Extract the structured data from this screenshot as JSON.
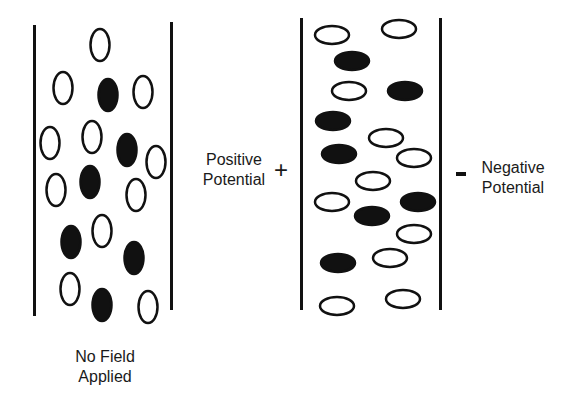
{
  "diagram": {
    "left_panel": {
      "caption_line1": "No Field",
      "caption_line2": "Applied",
      "particles": [
        {
          "cx": 100,
          "cy": 45,
          "filled": false
        },
        {
          "cx": 63,
          "cy": 88,
          "filled": false
        },
        {
          "cx": 108,
          "cy": 95,
          "filled": true
        },
        {
          "cx": 143,
          "cy": 92,
          "filled": false
        },
        {
          "cx": 50,
          "cy": 143,
          "filled": false
        },
        {
          "cx": 92,
          "cy": 137,
          "filled": false
        },
        {
          "cx": 127,
          "cy": 150,
          "filled": true
        },
        {
          "cx": 156,
          "cy": 162,
          "filled": false
        },
        {
          "cx": 56,
          "cy": 190,
          "filled": false
        },
        {
          "cx": 90,
          "cy": 182,
          "filled": true
        },
        {
          "cx": 136,
          "cy": 195,
          "filled": false
        },
        {
          "cx": 71,
          "cy": 242,
          "filled": true
        },
        {
          "cx": 102,
          "cy": 231,
          "filled": false
        },
        {
          "cx": 134,
          "cy": 258,
          "filled": true
        },
        {
          "cx": 70,
          "cy": 289,
          "filled": false
        },
        {
          "cx": 102,
          "cy": 305,
          "filled": true
        },
        {
          "cx": 148,
          "cy": 307,
          "filled": false
        }
      ]
    },
    "right_panel": {
      "particles": [
        {
          "cx": 332,
          "cy": 35,
          "filled": false
        },
        {
          "cx": 399,
          "cy": 29,
          "filled": false
        },
        {
          "cx": 352,
          "cy": 61,
          "filled": true
        },
        {
          "cx": 349,
          "cy": 91,
          "filled": false
        },
        {
          "cx": 405,
          "cy": 91,
          "filled": true
        },
        {
          "cx": 333,
          "cy": 121,
          "filled": true
        },
        {
          "cx": 386,
          "cy": 138,
          "filled": false
        },
        {
          "cx": 339,
          "cy": 154,
          "filled": true
        },
        {
          "cx": 414,
          "cy": 158,
          "filled": false
        },
        {
          "cx": 373,
          "cy": 181,
          "filled": false
        },
        {
          "cx": 332,
          "cy": 202,
          "filled": false
        },
        {
          "cx": 418,
          "cy": 202,
          "filled": true
        },
        {
          "cx": 372,
          "cy": 216,
          "filled": true
        },
        {
          "cx": 414,
          "cy": 234,
          "filled": false
        },
        {
          "cx": 338,
          "cy": 263,
          "filled": true
        },
        {
          "cx": 390,
          "cy": 258,
          "filled": false
        },
        {
          "cx": 337,
          "cy": 306,
          "filled": false
        },
        {
          "cx": 403,
          "cy": 299,
          "filled": false
        }
      ]
    },
    "positive": {
      "line1": "Positive",
      "line2": "Potential",
      "sign": "+"
    },
    "negative": {
      "line1": "Negative",
      "line2": "Potential",
      "sign": "-"
    }
  }
}
